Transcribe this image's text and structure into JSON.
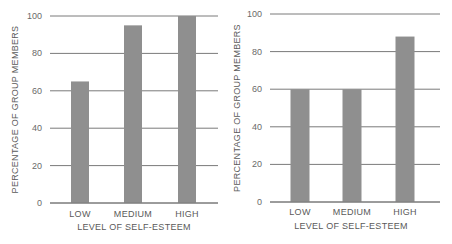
{
  "chart_data": [
    {
      "type": "bar",
      "title": "",
      "xlabel": "LEVEL OF SELF-ESTEEM",
      "ylabel": "PERCENTAGE OF GROUP MEMBERS",
      "categories": [
        "LOW",
        "MEDIUM",
        "HIGH"
      ],
      "values": [
        65,
        95,
        100
      ],
      "yticks": [
        "0",
        "20",
        "40",
        "60",
        "80",
        "100"
      ],
      "ylim": [
        0,
        100
      ],
      "grid": true,
      "bar_color": "#8f8f8f"
    },
    {
      "type": "bar",
      "title": "",
      "xlabel": "LEVEL OF SELF-ESTEEM",
      "ylabel": "PERCENTAGE OF GROUP MEMBERS",
      "categories": [
        "LOW",
        "MEDIUM",
        "HIGH"
      ],
      "values": [
        60,
        60,
        88
      ],
      "yticks": [
        "0",
        "20",
        "40",
        "60",
        "80",
        "100"
      ],
      "ylim": [
        0,
        100
      ],
      "grid": true,
      "bar_color": "#8f8f8f"
    }
  ]
}
